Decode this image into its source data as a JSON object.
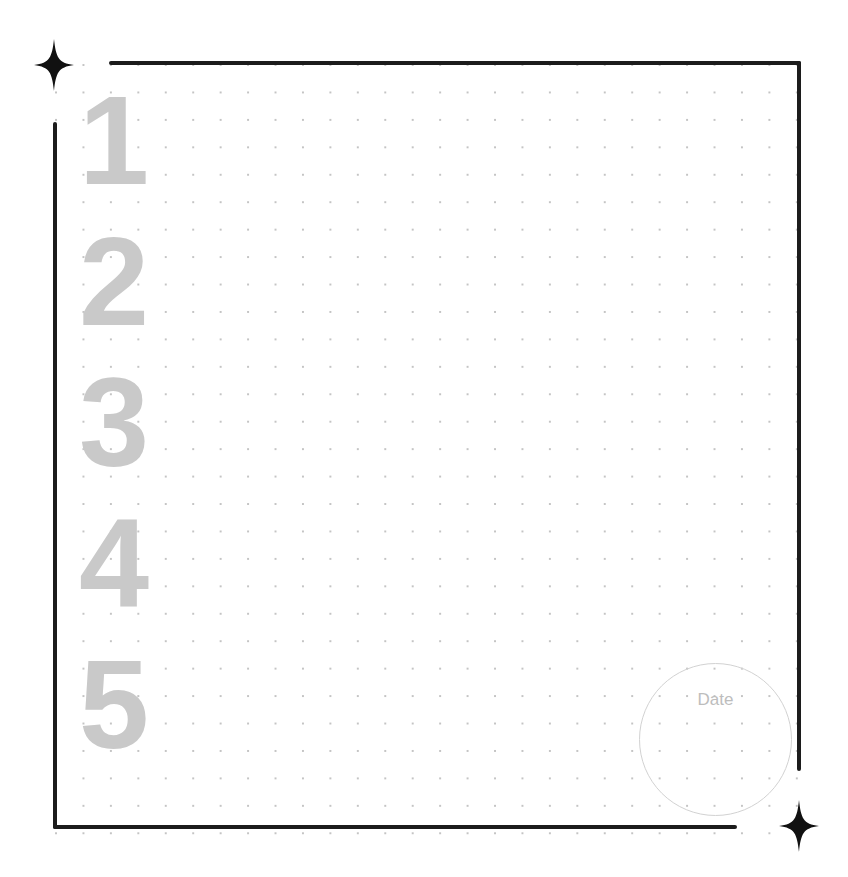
{
  "page": {
    "numbers": [
      "1",
      "2",
      "3",
      "4",
      "5"
    ],
    "date_label": "Date",
    "icons": {
      "top_left": "four-point-star-icon",
      "bottom_right": "four-point-star-icon"
    },
    "colors": {
      "frame": "#1c1c1c",
      "numbers": "#c9c9c9",
      "dots": "#c4c4c4",
      "date_circle": "#d2d2d2",
      "date_text": "#bdbdbd"
    }
  }
}
